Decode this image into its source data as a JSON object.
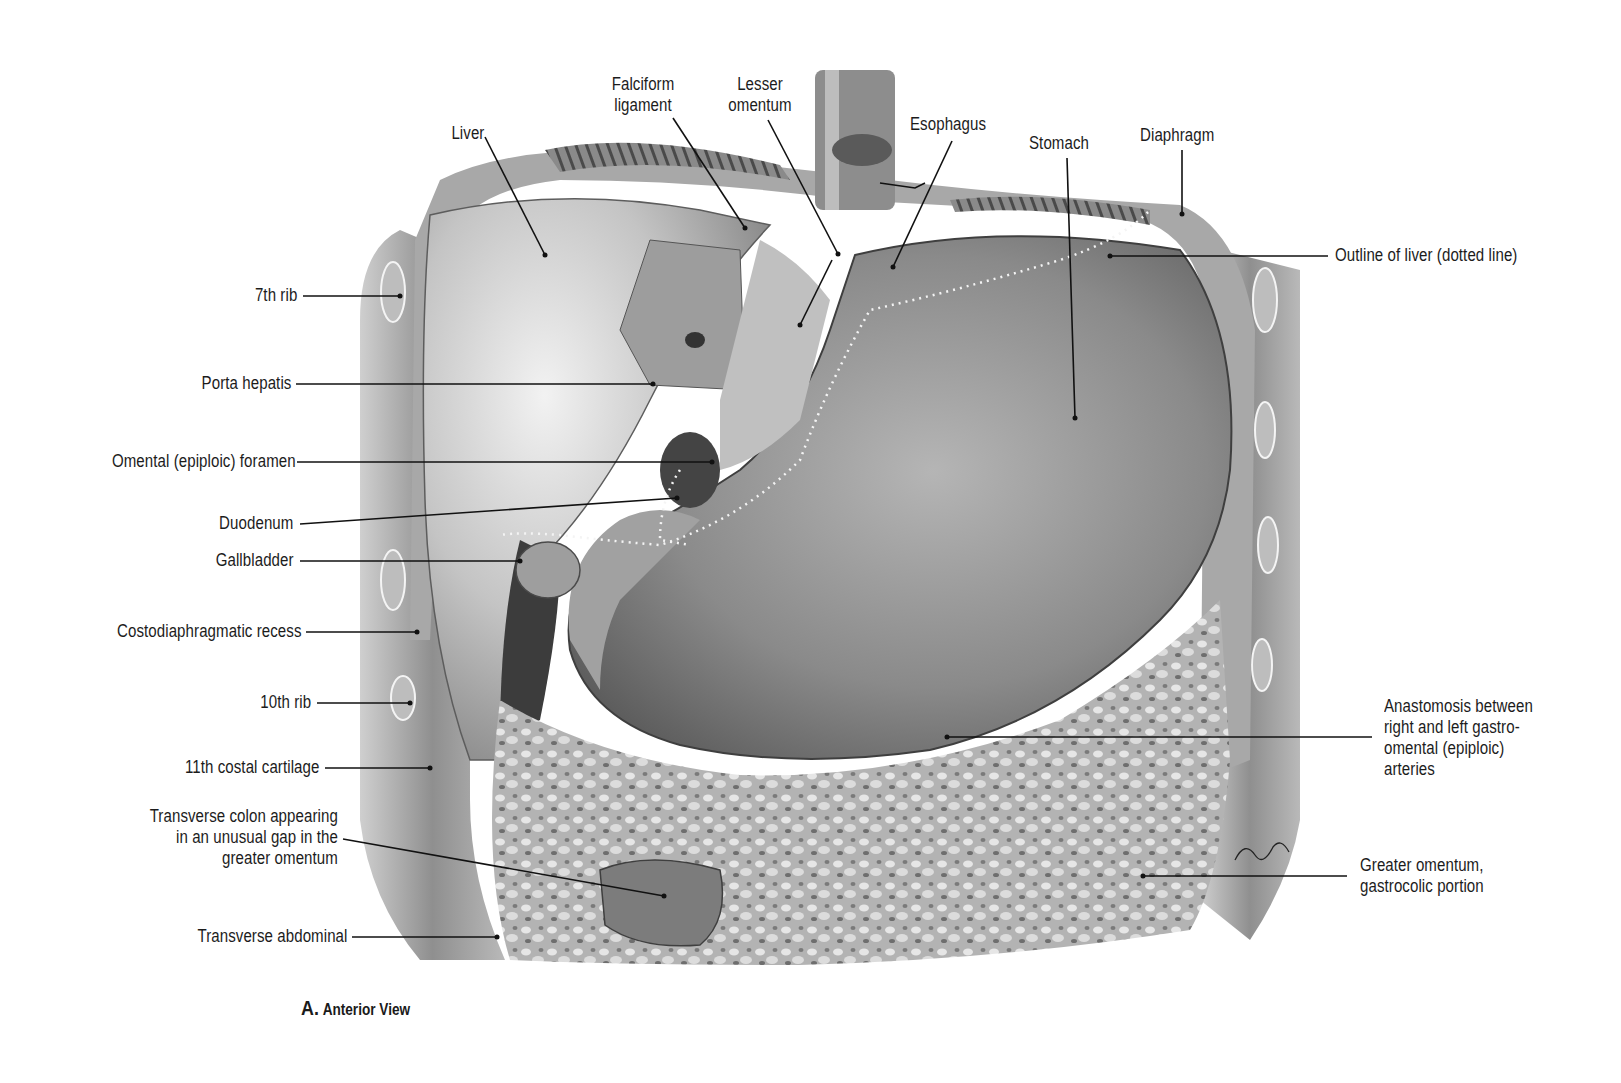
{
  "figure": {
    "caption": {
      "letter": "A.",
      "text": "Anterior View"
    },
    "style": {
      "ink": "#1c1c1c",
      "leader_line": "#111111",
      "tissue_light": "#d9d9d9",
      "tissue_mid": "#9a9a9a",
      "tissue_dark": "#3a3a3a"
    },
    "labels": {
      "liver": "Liver",
      "falciform": "Falciform\nligament",
      "lesser_omentum": "Lesser\nomentum",
      "esophagus": "Esophagus",
      "stomach": "Stomach",
      "diaphragm": "Diaphragm",
      "outline_liver": "Outline of liver (dotted line)",
      "rib7": "7th rib",
      "porta_hepatis": "Porta hepatis",
      "omental_foramen": "Omental (epiploic) foramen",
      "duodenum": "Duodenum",
      "gallbladder": "Gallbladder",
      "costodiaphragmatic": "Costodiaphragmatic recess",
      "rib10": "10th rib",
      "costal11": "11th costal cartilage",
      "transverse_colon": "Transverse colon appearing\nin an unusual gap in the\ngreater omentum",
      "transverse_abdominal": "Transverse abdominal",
      "anastomosis": "Anastomosis between\nright and left gastro-\nomental (epiploic)\narteries",
      "greater_omentum": "Greater omentum,\ngastrocolic portion"
    }
  }
}
